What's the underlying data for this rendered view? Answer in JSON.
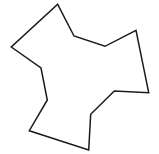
{
  "figure": {
    "type": "polygon-outline",
    "width": 159,
    "height": 154,
    "background": "#ffffff",
    "stroke_color": "#1a1a1a",
    "stroke_width": 1.5,
    "fill": "none",
    "vertex_count": 12,
    "vertices": [
      [
        57.7,
        4.3
      ],
      [
        74,
        36
      ],
      [
        105,
        46.3
      ],
      [
        136,
        30.3
      ],
      [
        148.7,
        92.7
      ],
      [
        114.3,
        91
      ],
      [
        90.7,
        114.3
      ],
      [
        88.7,
        150
      ],
      [
        29.3,
        130.7
      ],
      [
        47.3,
        100
      ],
      [
        41,
        68
      ],
      [
        11.3,
        47
      ]
    ]
  }
}
